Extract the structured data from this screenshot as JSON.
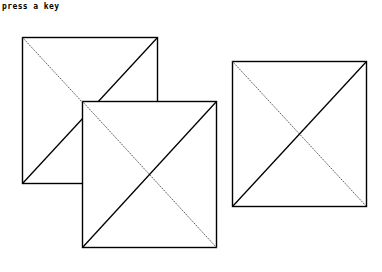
{
  "prompt": {
    "text": "press a key"
  },
  "colors": {
    "background": "#ffffff",
    "stroke": "#000000",
    "dotted_stroke": "#555555"
  },
  "squares": [
    {
      "id": "square-1",
      "x": 22,
      "y": 37,
      "w": 135,
      "h": 146
    },
    {
      "id": "square-2",
      "x": 82,
      "y": 101,
      "w": 134,
      "h": 146
    },
    {
      "id": "square-3",
      "x": 232,
      "y": 61,
      "w": 134,
      "h": 145
    }
  ]
}
